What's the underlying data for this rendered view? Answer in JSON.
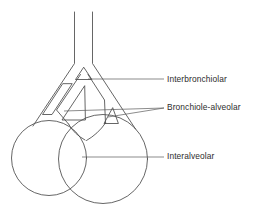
{
  "figure": {
    "name": "pores-of-collateral-ventilation-diagram",
    "background_color": "#ffffff",
    "stroke_color": "#4a4a4a",
    "text_color": "#2d2d2d",
    "width": 258,
    "height": 210
  },
  "labels": [
    {
      "id": "interbronchiolar",
      "text": "Interbronchiolar",
      "x": 167,
      "y": 75,
      "leader": {
        "x1": 88,
        "y1": 79,
        "x2": 164,
        "y2": 79
      }
    },
    {
      "id": "bronchiole_alveolar",
      "text": "Bronchiole-alveolar",
      "x": 167,
      "y": 103,
      "leader": {
        "x1": 64,
        "y1": 111,
        "x2": 164,
        "y2": 108
      },
      "leader2": {
        "x1": 108,
        "y1": 117,
        "x2": 164,
        "y2": 108
      }
    },
    {
      "id": "interalveolar",
      "text": "Interalveolar",
      "x": 167,
      "y": 152,
      "leader": {
        "x1": 82,
        "y1": 157,
        "x2": 164,
        "y2": 157
      }
    }
  ],
  "structures": {
    "airway_tube_left_wall": "vertical bronchiole wall, left side",
    "airway_tube_right_wall": "vertical bronchiole wall, right side",
    "bifurcation": "airway splits into two daughter bronchioles",
    "interbronchiolar_pore": "small triangular pore at the carina between bronchioles",
    "bronchiole_alveolar_pore_left": "elongated channel along left bronchiole wall",
    "bronchiole_alveolar_pore_right": "small triangular pore between bronchiole and alveolus",
    "alveolar_sac_left": "left alveolar sac circle",
    "alveolar_sac_right": "right alveolar sac circle",
    "interalveolar_pore": "septum between the two alveolar sacs"
  },
  "diagram_type": "anatomical line drawing"
}
